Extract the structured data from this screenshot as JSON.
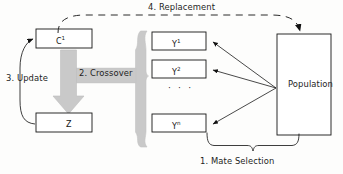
{
  "diagram": {
    "colors": {
      "stroke": "#1a1a1a",
      "gray_arrow": "#c9c9c9",
      "gray_arrow_edge": "#bdbdbd",
      "background": "#fdfdfc",
      "text": "#1a1a1a"
    },
    "nodes": {
      "c1": {
        "label": "C",
        "superscript": "1",
        "x": 36,
        "y": 29,
        "w": 56,
        "h": 19
      },
      "z": {
        "label": "Z",
        "superscript": "",
        "x": 36,
        "y": 113,
        "w": 56,
        "h": 19
      },
      "y1": {
        "label": "Y",
        "superscript": "1",
        "x": 152,
        "y": 32,
        "w": 54,
        "h": 18
      },
      "y2": {
        "label": "Y",
        "superscript": "2",
        "x": 152,
        "y": 60,
        "w": 54,
        "h": 18
      },
      "yn": {
        "label": "Y",
        "superscript": "n",
        "x": 152,
        "y": 114,
        "w": 54,
        "h": 18
      },
      "population": {
        "label": "Population",
        "x": 277,
        "y": 34,
        "w": 54,
        "h": 101
      },
      "ellipsis": {
        "label": "· · ·"
      }
    },
    "steps": [
      {
        "id": "mate-selection",
        "label": "1. Mate Selection"
      },
      {
        "id": "crossover",
        "label": "2. Crossover"
      },
      {
        "id": "update",
        "label": "3. Update"
      },
      {
        "id": "replacement",
        "label": "4. Replacement"
      }
    ],
    "step_labels": {
      "replacement": "4. Replacement",
      "update": "3. Update",
      "crossover": "2. Crossover",
      "mate_selection": "1. Mate Selection"
    }
  }
}
